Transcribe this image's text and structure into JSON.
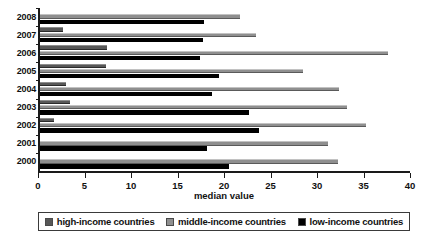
{
  "chart_data": {
    "type": "bar",
    "orientation": "horizontal",
    "title": "",
    "xlabel": "median value",
    "ylabel": "",
    "xlim": [
      0,
      40
    ],
    "ylim": null,
    "grid": false,
    "legend_position": "bottom",
    "categories": [
      "2008",
      "2007",
      "2006",
      "2005",
      "2004",
      "2003",
      "2002",
      "2001",
      "2000"
    ],
    "xticks": [
      0,
      5,
      10,
      15,
      20,
      25,
      30,
      35,
      40
    ],
    "xtick_labels": [
      "0",
      "5",
      "10",
      "15",
      "20",
      "25",
      "30",
      "35",
      "40"
    ],
    "series": [
      {
        "name": "high-income countries",
        "color": "#575757",
        "values": [
          0,
          2.5,
          7.2,
          7.1,
          2.8,
          3.2,
          1.5,
          0,
          0
        ]
      },
      {
        "name": "middle-income countries",
        "color": "#8f8f8f",
        "values": [
          21.5,
          23.2,
          37.4,
          28.3,
          32.2,
          33.0,
          35.0,
          31.0,
          32.0
        ]
      },
      {
        "name": "low-income countries",
        "color": "#000000",
        "values": [
          17.6,
          17.5,
          17.2,
          19.3,
          18.5,
          22.5,
          23.5,
          18.0,
          20.3
        ]
      }
    ]
  },
  "legend": {
    "items": [
      {
        "label": "high-income countries",
        "color": "#575757"
      },
      {
        "label": "middle-income countries",
        "color": "#8f8f8f"
      },
      {
        "label": "low-income countries",
        "color": "#000000"
      }
    ]
  },
  "axis": {
    "x_title": "median value"
  }
}
